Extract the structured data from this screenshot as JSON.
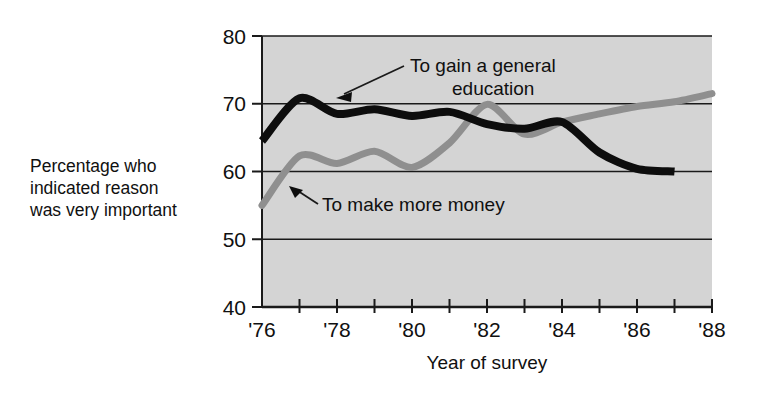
{
  "chart_data": {
    "type": "line",
    "title": "",
    "xlabel": "Year of survey",
    "ylabel": "Percentage who indicated reason was very important",
    "ylabel_lines": [
      "Percentage who",
      "indicated reason",
      "was very important"
    ],
    "xlim": [
      1976,
      1988
    ],
    "ylim": [
      40,
      80
    ],
    "ytick_values": [
      40,
      50,
      60,
      70,
      80
    ],
    "ytick_labels": [
      "40",
      "50",
      "60",
      "70",
      "80"
    ],
    "xtick_values": [
      1976,
      1977,
      1978,
      1979,
      1980,
      1981,
      1982,
      1983,
      1984,
      1985,
      1986,
      1987,
      1988
    ],
    "xtick_labels": [
      "'76",
      "",
      "'78",
      "",
      "'80",
      "",
      "'82",
      "",
      "'84",
      "",
      "'86",
      "",
      "'88"
    ],
    "grid": "horizontal",
    "legend": "inline-annotations",
    "plot_background": "#d4d4d4",
    "series": [
      {
        "name": "To gain a general education",
        "color": "#0d0d0d",
        "annotation": "To gain a general education",
        "annotation_lines": [
          "To gain a general",
          "education"
        ],
        "x": [
          1976,
          1977,
          1978,
          1979,
          1980,
          1981,
          1982,
          1983,
          1984,
          1985,
          1986,
          1987
        ],
        "values": [
          64.5,
          70.8,
          68.5,
          69.2,
          68.2,
          68.8,
          67.0,
          66.3,
          67.3,
          62.8,
          60.4,
          60.0
        ]
      },
      {
        "name": "To make more money",
        "color": "#8f8f8f",
        "annotation": "To make more money",
        "annotation_lines": [
          "To make more money"
        ],
        "x": [
          1976,
          1977,
          1978,
          1979,
          1980,
          1981,
          1982,
          1983,
          1984,
          1985,
          1986,
          1987,
          1988
        ],
        "values": [
          55.0,
          62.3,
          61.2,
          63.0,
          60.6,
          64.2,
          69.9,
          65.5,
          67.3,
          68.5,
          69.6,
          70.3,
          71.5
        ]
      }
    ]
  },
  "annotations": {
    "series_a_label_lines": [
      "To gain a general",
      "education"
    ],
    "series_b_label": "To make more money"
  },
  "axes": {
    "x_title": "Year of survey",
    "y_title_lines": [
      "Percentage who",
      "indicated reason",
      "was very important"
    ]
  }
}
